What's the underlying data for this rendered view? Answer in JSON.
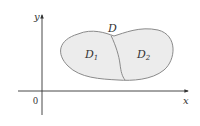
{
  "diagram": {
    "axes": {
      "x_label": "x",
      "y_label": "y",
      "origin_label": "0"
    },
    "region": {
      "label": "D",
      "subregions": [
        {
          "label": "D",
          "subscript": "1"
        },
        {
          "label": "D",
          "subscript": "2"
        }
      ]
    },
    "colors": {
      "axis": "#333333",
      "region_fill": "#ececec",
      "region_stroke": "#8a8a8a",
      "text": "#333333"
    }
  }
}
